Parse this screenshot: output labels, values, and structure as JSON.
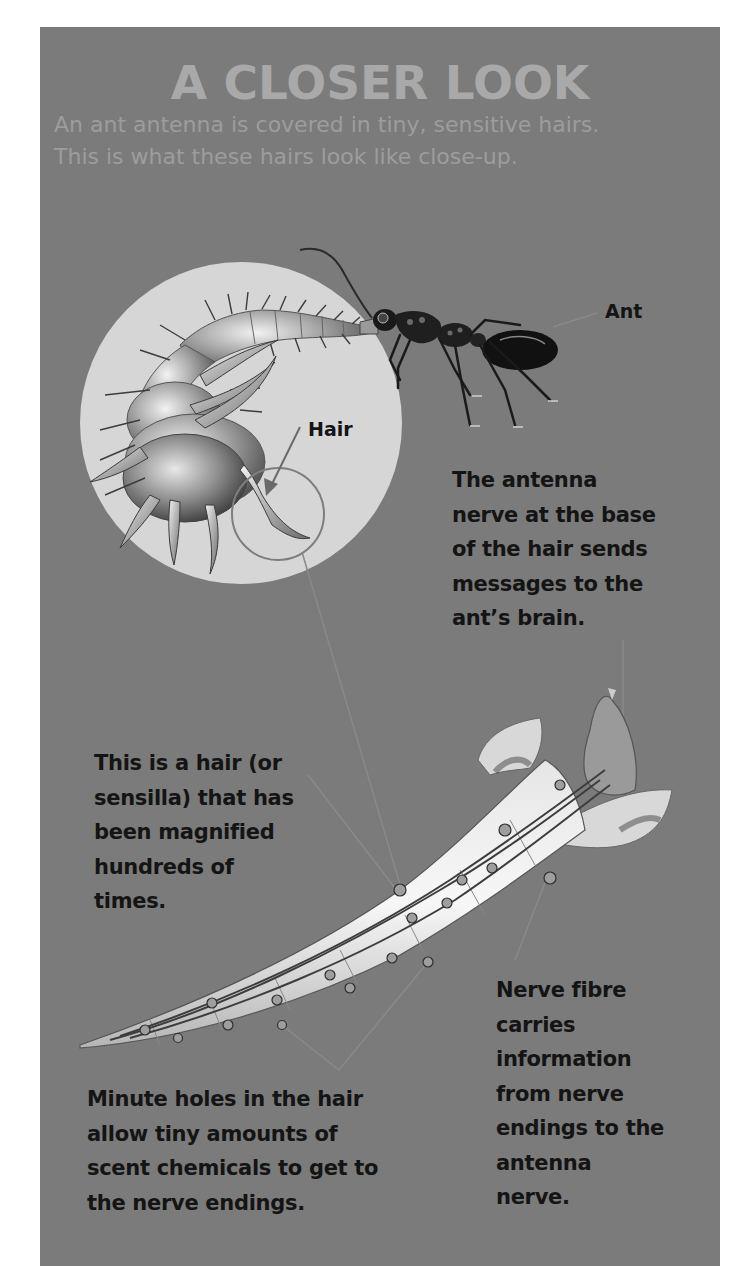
{
  "header": {
    "title": "A CLOSER LOOK",
    "subtitle_lines": [
      "An ant antenna is covered in tiny, sensitive hairs.",
      "This is what these hairs look like close-up."
    ]
  },
  "labels": {
    "ant": "Ant",
    "hair": "Hair",
    "antenna_nerve": {
      "lines": [
        "The antenna",
        "nerve at the base",
        "of the hair sends",
        "messages to the",
        "ant’s brain."
      ]
    },
    "sensilla": {
      "lines": [
        "This is a hair (or",
        "sensilla) that has",
        "been magnified",
        "hundreds of",
        "times."
      ]
    },
    "nerve_fibre": {
      "lines": [
        "Nerve fibre",
        "carries",
        "information",
        "from nerve",
        "endings to the",
        "antenna",
        "nerve."
      ]
    },
    "minute_holes": {
      "lines": [
        "Minute holes in the hair",
        "allow tiny amounts of",
        "scent chemicals to get to",
        "the nerve endings."
      ]
    }
  },
  "colors": {
    "panel_background": "#7b7b7b",
    "title": "#a9a9a9",
    "subtitle": "#9d9d9d",
    "label_text": "#141414",
    "magnifier_disc": "#d6d6d6",
    "pointer_line": "#8a8a8a"
  }
}
